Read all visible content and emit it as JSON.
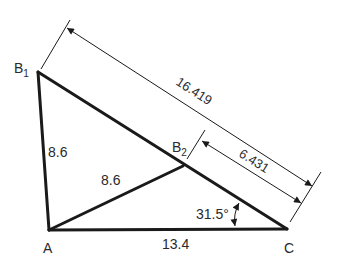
{
  "diagram": {
    "type": "geometry-triangle",
    "colors": {
      "line": "#1a1a1a",
      "text": "#2a2a2a",
      "background": "#ffffff"
    },
    "vertices": {
      "B1": {
        "label": "B",
        "subscript": "1"
      },
      "B2": {
        "label": "B",
        "subscript": "2"
      },
      "A": {
        "label": "A"
      },
      "C": {
        "label": "C"
      }
    },
    "sides": {
      "AB1": "8.6",
      "AB2": "8.6",
      "AC": "13.4"
    },
    "dimensions": {
      "B1C": "16.419",
      "B2C": "6.431"
    },
    "angle": {
      "at": "C",
      "value": "31.5°"
    }
  }
}
